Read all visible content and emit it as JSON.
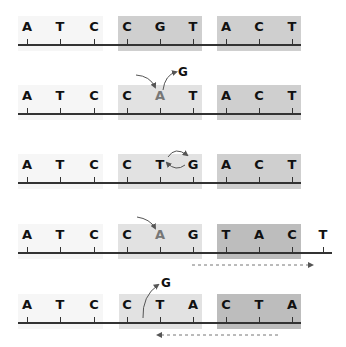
{
  "colors": {
    "box_faint": "#f6f6f6",
    "box_light": "#e2e2e2",
    "box_dark": "#cfcfcf",
    "box_darker": "#bdbdbd",
    "line": "#333333",
    "mutated_letter": "#777777",
    "arrow": "#555555"
  },
  "rows": [
    {
      "id": "original",
      "sequence": [
        "A",
        "T",
        "C",
        "C",
        "G",
        "T",
        "A",
        "C",
        "T"
      ],
      "annotation": ""
    },
    {
      "id": "substitution",
      "sequence": [
        "A",
        "T",
        "C",
        "C",
        "A",
        "T",
        "A",
        "C",
        "T"
      ],
      "mutated_index": 4,
      "removed_base": "G",
      "annotation": "G"
    },
    {
      "id": "inversion",
      "sequence": [
        "A",
        "T",
        "C",
        "C",
        "T",
        "G",
        "A",
        "C",
        "T"
      ],
      "annotation": ""
    },
    {
      "id": "insertion",
      "sequence": [
        "A",
        "T",
        "C",
        "C",
        "A",
        "G",
        "T",
        "A",
        "C",
        "T"
      ],
      "mutated_index": 4,
      "shift_direction": "right",
      "annotation": ""
    },
    {
      "id": "deletion",
      "sequence": [
        "A",
        "T",
        "C",
        "C",
        "T",
        "A",
        "C",
        "T",
        "A"
      ],
      "removed_base": "G",
      "shift_direction": "left",
      "annotation": "G"
    }
  ]
}
